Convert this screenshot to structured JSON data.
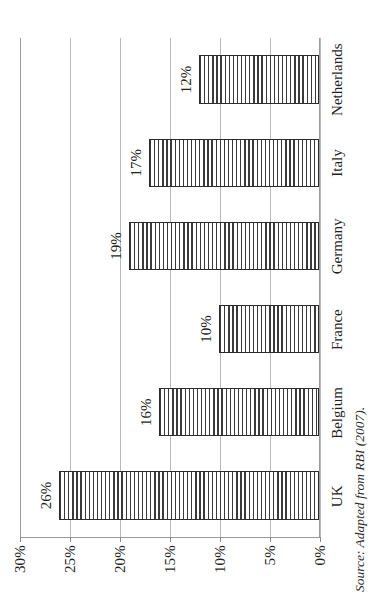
{
  "chart_data": {
    "type": "bar",
    "title": "",
    "xlabel": "",
    "ylabel": "",
    "categories": [
      "UK",
      "Belgium",
      "France",
      "Germany",
      "Italy",
      "Netherlands"
    ],
    "values": [
      26,
      16,
      10,
      19,
      17,
      12
    ],
    "value_labels": [
      "26%",
      "16%",
      "10%",
      "19%",
      "17%",
      "12%"
    ],
    "ylim": [
      0,
      30
    ],
    "ytick_values": [
      0,
      5,
      10,
      15,
      20,
      25,
      30
    ],
    "ytick_labels": [
      "0%",
      "5%",
      "10%",
      "15%",
      "20%",
      "25%",
      "30%"
    ],
    "grid": "horizontal",
    "legend": "none",
    "orientation": "rotated-90-ccw",
    "series": [
      {
        "name": "",
        "values": [
          26,
          16,
          10,
          19,
          17,
          12
        ]
      }
    ],
    "annotations": {
      "source": "Source: Adapted from RBI (2007)."
    },
    "colors": {
      "bar_fill": "#ffffff",
      "bar_hatch": "#3a3a3a",
      "bar_border": "#2b2b2b",
      "gridline": "#b9b9b9",
      "axis": "#9a9a9a",
      "text": "#1f1f1f"
    }
  }
}
